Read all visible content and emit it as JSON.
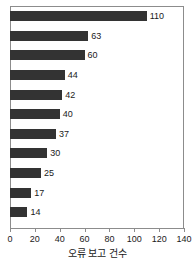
{
  "chart_data": {
    "type": "bar",
    "orientation": "horizontal",
    "title": "",
    "subtitle": "",
    "xlabel": "오류 보고 건수",
    "ylabel": "",
    "categories": [
      "",
      "",
      "",
      "",
      "",
      "",
      "",
      "",
      "",
      "",
      ""
    ],
    "values": [
      110,
      63,
      60,
      44,
      42,
      40,
      37,
      30,
      25,
      17,
      14
    ],
    "data_labels": [
      "110",
      "63",
      "60",
      "44",
      "42",
      "40",
      "37",
      "30",
      "25",
      "17",
      "14"
    ],
    "xlim": [
      0,
      140
    ],
    "ylim": [
      0,
      11
    ],
    "xticks": [
      0,
      20,
      40,
      60,
      80,
      100,
      120,
      140
    ],
    "xtick_labels": [
      "0",
      "20",
      "40",
      "60",
      "80",
      "100",
      "120",
      "140"
    ],
    "grid": false,
    "legend": null,
    "bar_color": "#333333",
    "axis_color": "#8c8c8c",
    "text_color": "#1a1a1a",
    "background": "#ffffff"
  }
}
